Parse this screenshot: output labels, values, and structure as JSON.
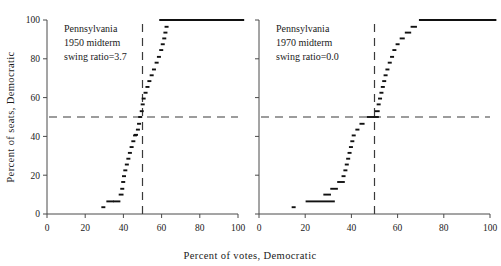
{
  "figure": {
    "xlabel": "Percent  of  votes, Democratic",
    "ylabel": "Percent  of  seats,  Democratic"
  },
  "chart_data": {
    "type": "line",
    "title": "",
    "xlabel": "Percent of votes, Democratic",
    "ylabel": "Percent of seats, Democratic",
    "xlim": [
      0,
      100
    ],
    "ylim": [
      0,
      100
    ],
    "xticks": [
      0,
      20,
      40,
      60,
      80,
      100
    ],
    "yticks": [
      0,
      20,
      40,
      60,
      80,
      100
    ],
    "grid": false,
    "legend": "none",
    "reference_lines": [
      {
        "orientation": "horizontal",
        "value": 50,
        "style": "dashed"
      },
      {
        "orientation": "vertical",
        "value": 50,
        "style": "dashed"
      }
    ],
    "panels": [
      {
        "name": "pennsylvania-1950",
        "annotation_lines": [
          "Pennsylvania",
          "1950 midterm",
          "swing ratio=3.7"
        ],
        "state": "Pennsylvania",
        "year": "1950",
        "election_type": "midterm",
        "swing_ratio": "3.7",
        "series": [
          {
            "name": "seats-votes curve",
            "marker": "short horizontal dash",
            "points": [
              {
                "x": 29.5,
                "y": 3.5
              },
              {
                "x": 33.0,
                "y": 6.5
              },
              {
                "x": 36.5,
                "y": 6.5
              },
              {
                "x": 38.8,
                "y": 10.0
              },
              {
                "x": 39.4,
                "y": 13.0
              },
              {
                "x": 39.9,
                "y": 16.5
              },
              {
                "x": 40.3,
                "y": 19.5
              },
              {
                "x": 41.0,
                "y": 22.5
              },
              {
                "x": 41.8,
                "y": 25.5
              },
              {
                "x": 42.6,
                "y": 28.5
              },
              {
                "x": 43.4,
                "y": 31.5
              },
              {
                "x": 44.3,
                "y": 34.5
              },
              {
                "x": 45.2,
                "y": 37.5
              },
              {
                "x": 46.1,
                "y": 40.5
              },
              {
                "x": 46.6,
                "y": 40.8
              },
              {
                "x": 47.6,
                "y": 43.5
              },
              {
                "x": 48.2,
                "y": 46.5
              },
              {
                "x": 48.8,
                "y": 50.0
              },
              {
                "x": 49.6,
                "y": 53.0
              },
              {
                "x": 50.1,
                "y": 56.5
              },
              {
                "x": 50.6,
                "y": 59.5
              },
              {
                "x": 51.6,
                "y": 62.5
              },
              {
                "x": 52.6,
                "y": 65.5
              },
              {
                "x": 53.6,
                "y": 68.5
              },
              {
                "x": 54.8,
                "y": 71.5
              },
              {
                "x": 56.0,
                "y": 74.5
              },
              {
                "x": 57.4,
                "y": 78.0
              },
              {
                "x": 58.6,
                "y": 81.0
              },
              {
                "x": 59.8,
                "y": 84.5
              },
              {
                "x": 60.6,
                "y": 87.5
              },
              {
                "x": 61.4,
                "y": 90.5
              },
              {
                "x": 62.0,
                "y": 93.5
              },
              {
                "x": 62.6,
                "y": 96.5
              },
              {
                "x": 81.0,
                "y": 100.0
              }
            ]
          }
        ]
      },
      {
        "name": "pennsylvania-1970",
        "annotation_lines": [
          "Pennsylvania",
          "1970 midterm",
          "swing ratio=0.0"
        ],
        "state": "Pennsylvania",
        "year": "1970",
        "election_type": "midterm",
        "swing_ratio": "0.0",
        "series": [
          {
            "name": "seats-votes curve",
            "marker": "short horizontal dash",
            "points": [
              {
                "x": 15.0,
                "y": 3.5
              },
              {
                "x": 26.5,
                "y": 6.5
              },
              {
                "x": 29.5,
                "y": 10.0
              },
              {
                "x": 32.5,
                "y": 13.0
              },
              {
                "x": 35.5,
                "y": 16.5
              },
              {
                "x": 36.6,
                "y": 19.5
              },
              {
                "x": 37.4,
                "y": 22.5
              },
              {
                "x": 38.0,
                "y": 25.5
              },
              {
                "x": 38.6,
                "y": 28.5
              },
              {
                "x": 39.2,
                "y": 31.5
              },
              {
                "x": 39.8,
                "y": 34.5
              },
              {
                "x": 40.4,
                "y": 37.5
              },
              {
                "x": 41.0,
                "y": 40.5
              },
              {
                "x": 42.6,
                "y": 43.5
              },
              {
                "x": 44.6,
                "y": 46.5
              },
              {
                "x": 49.3,
                "y": 50.0
              },
              {
                "x": 51.2,
                "y": 53.0
              },
              {
                "x": 51.8,
                "y": 56.5
              },
              {
                "x": 52.4,
                "y": 59.5
              },
              {
                "x": 53.0,
                "y": 62.5
              },
              {
                "x": 53.6,
                "y": 65.5
              },
              {
                "x": 54.2,
                "y": 68.5
              },
              {
                "x": 54.8,
                "y": 71.5
              },
              {
                "x": 55.6,
                "y": 74.5
              },
              {
                "x": 56.6,
                "y": 78.0
              },
              {
                "x": 57.6,
                "y": 81.0
              },
              {
                "x": 58.6,
                "y": 84.5
              },
              {
                "x": 60.0,
                "y": 87.5
              },
              {
                "x": 62.0,
                "y": 90.5
              },
              {
                "x": 64.5,
                "y": 93.5
              },
              {
                "x": 67.0,
                "y": 96.5
              },
              {
                "x": 86.0,
                "y": 100.0
              }
            ]
          }
        ]
      }
    ]
  }
}
